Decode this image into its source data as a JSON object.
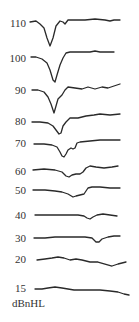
{
  "chart_data": {
    "type": "line",
    "title": "",
    "xlabel": "",
    "ylabel": "dBnHL",
    "grid": false,
    "legend": "none",
    "unit_label": "dBnHL",
    "series": [
      {
        "name": "110",
        "label_y": 23,
        "points": [
          [
            30,
            22
          ],
          [
            36,
            21
          ],
          [
            40,
            24
          ],
          [
            44,
            28
          ],
          [
            47,
            38
          ],
          [
            50,
            46
          ],
          [
            53,
            38
          ],
          [
            56,
            26
          ],
          [
            60,
            21
          ],
          [
            63,
            22
          ],
          [
            65,
            24
          ],
          [
            68,
            20
          ],
          [
            75,
            20
          ],
          [
            85,
            20
          ],
          [
            95,
            19
          ],
          [
            105,
            20
          ],
          [
            110,
            21
          ],
          [
            114,
            20
          ],
          [
            120,
            20
          ]
        ]
      },
      {
        "name": "100",
        "label_y": 58,
        "points": [
          [
            31,
            57
          ],
          [
            36,
            57
          ],
          [
            42,
            59
          ],
          [
            47,
            63
          ],
          [
            50,
            70
          ],
          [
            53,
            80
          ],
          [
            55,
            82
          ],
          [
            57,
            75
          ],
          [
            60,
            65
          ],
          [
            63,
            58
          ],
          [
            66,
            53
          ],
          [
            70,
            52
          ],
          [
            80,
            52
          ],
          [
            90,
            52
          ],
          [
            95,
            51
          ],
          [
            100,
            52
          ],
          [
            106,
            52
          ],
          [
            114,
            52
          ]
        ]
      },
      {
        "name": "90",
        "label_y": 90,
        "points": [
          [
            32,
            90
          ],
          [
            38,
            90
          ],
          [
            44,
            92
          ],
          [
            48,
            97
          ],
          [
            51,
            104
          ],
          [
            54,
            113
          ],
          [
            56,
            106
          ],
          [
            58,
            99
          ],
          [
            62,
            95
          ],
          [
            65,
            90
          ],
          [
            68,
            87
          ],
          [
            75,
            88
          ],
          [
            82,
            89
          ],
          [
            88,
            87
          ],
          [
            95,
            89
          ],
          [
            102,
            87
          ],
          [
            108,
            88
          ],
          [
            114,
            86
          ],
          [
            120,
            84
          ]
        ]
      },
      {
        "name": "80",
        "label_y": 121,
        "points": [
          [
            32,
            122
          ],
          [
            40,
            122
          ],
          [
            48,
            123
          ],
          [
            53,
            126
          ],
          [
            56,
            130
          ],
          [
            59,
            134
          ],
          [
            61,
            133
          ],
          [
            63,
            126
          ],
          [
            66,
            122
          ],
          [
            70,
            118
          ],
          [
            78,
            118
          ],
          [
            86,
            116
          ],
          [
            94,
            115
          ],
          [
            100,
            114
          ],
          [
            110,
            115
          ],
          [
            120,
            114
          ]
        ]
      },
      {
        "name": "70",
        "label_y": 143,
        "points": [
          [
            34,
            144
          ],
          [
            44,
            144
          ],
          [
            52,
            145
          ],
          [
            57,
            147
          ],
          [
            60,
            152
          ],
          [
            62,
            156
          ],
          [
            64,
            157
          ],
          [
            66,
            154
          ],
          [
            68,
            150
          ],
          [
            71,
            148
          ],
          [
            73,
            149
          ],
          [
            75,
            148
          ],
          [
            77,
            143
          ],
          [
            80,
            142
          ],
          [
            90,
            141
          ],
          [
            100,
            140
          ],
          [
            110,
            140
          ],
          [
            120,
            140
          ]
        ]
      },
      {
        "name": "60",
        "label_y": 171,
        "points": [
          [
            33,
            170
          ],
          [
            44,
            169
          ],
          [
            55,
            170
          ],
          [
            62,
            172
          ],
          [
            66,
            176
          ],
          [
            69,
            177
          ],
          [
            72,
            175
          ],
          [
            76,
            174
          ],
          [
            80,
            174
          ],
          [
            83,
            172
          ],
          [
            86,
            168
          ],
          [
            90,
            166
          ],
          [
            96,
            167
          ],
          [
            104,
            168
          ],
          [
            112,
            167
          ],
          [
            118,
            166
          ]
        ]
      },
      {
        "name": "50",
        "label_y": 190,
        "points": [
          [
            33,
            190
          ],
          [
            45,
            190
          ],
          [
            55,
            191
          ],
          [
            62,
            192
          ],
          [
            68,
            194
          ],
          [
            73,
            197
          ],
          [
            76,
            196
          ],
          [
            80,
            195
          ],
          [
            84,
            194
          ],
          [
            86,
            191
          ],
          [
            88,
            188
          ],
          [
            92,
            187
          ],
          [
            100,
            187
          ],
          [
            110,
            188
          ],
          [
            120,
            188
          ]
        ]
      },
      {
        "name": "40",
        "label_y": 215,
        "points": [
          [
            35,
            215
          ],
          [
            50,
            215
          ],
          [
            65,
            215
          ],
          [
            78,
            215
          ],
          [
            84,
            216
          ],
          [
            87,
            218
          ],
          [
            90,
            219
          ],
          [
            93,
            217
          ],
          [
            97,
            215
          ],
          [
            103,
            214
          ],
          [
            110,
            215
          ],
          [
            117,
            216
          ]
        ]
      },
      {
        "name": "30",
        "label_y": 238,
        "points": [
          [
            34,
            238
          ],
          [
            45,
            238
          ],
          [
            55,
            237
          ],
          [
            65,
            237
          ],
          [
            75,
            237
          ],
          [
            85,
            237
          ],
          [
            92,
            238
          ],
          [
            96,
            242
          ],
          [
            99,
            242
          ],
          [
            102,
            239
          ],
          [
            108,
            237
          ],
          [
            114,
            236
          ],
          [
            120,
            236
          ]
        ]
      },
      {
        "name": "20",
        "label_y": 259,
        "points": [
          [
            37,
            260
          ],
          [
            45,
            259
          ],
          [
            52,
            258
          ],
          [
            58,
            257
          ],
          [
            64,
            258
          ],
          [
            70,
            260
          ],
          [
            76,
            259
          ],
          [
            82,
            260
          ],
          [
            90,
            262
          ],
          [
            98,
            262
          ],
          [
            105,
            264
          ],
          [
            112,
            266
          ],
          [
            118,
            264
          ],
          [
            126,
            262
          ]
        ]
      },
      {
        "name": "15",
        "label_y": 288,
        "points": [
          [
            35,
            289
          ],
          [
            42,
            289
          ],
          [
            48,
            288
          ],
          [
            55,
            287
          ],
          [
            62,
            288
          ],
          [
            68,
            289
          ],
          [
            74,
            290
          ],
          [
            80,
            290
          ],
          [
            90,
            290
          ],
          [
            100,
            290
          ],
          [
            110,
            291
          ],
          [
            118,
            292
          ],
          [
            124,
            294
          ],
          [
            129,
            295
          ]
        ]
      }
    ]
  }
}
